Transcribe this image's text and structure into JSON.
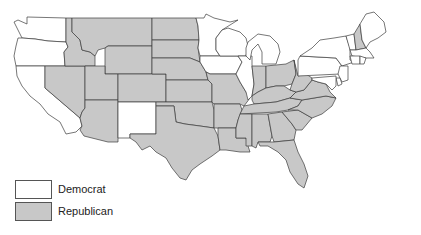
{
  "chart_data": {
    "type": "choropleth",
    "title": "",
    "legend_position": "bottom-left",
    "legend": [
      {
        "label": "Democrat",
        "color": "#ffffff"
      },
      {
        "label": "Republican",
        "color": "#c8c8c8"
      }
    ],
    "states": {
      "Democrat": [
        "WA",
        "OR",
        "CA",
        "NM",
        "MN",
        "WI",
        "IA",
        "IL",
        "MI",
        "PA",
        "NY",
        "VT",
        "ME",
        "MA",
        "RI",
        "CT",
        "NJ",
        "DE",
        "MD",
        "DC",
        "HI"
      ],
      "Republican": [
        "ID",
        "MT",
        "WY",
        "NV",
        "UT",
        "AZ",
        "CO",
        "ND",
        "SD",
        "NE",
        "KS",
        "OK",
        "TX",
        "MO",
        "AR",
        "LA",
        "MS",
        "AL",
        "GA",
        "FL",
        "SC",
        "NC",
        "TN",
        "KY",
        "IN",
        "OH",
        "WV",
        "VA",
        "NH",
        "AK"
      ]
    }
  },
  "legend": {
    "items": [
      {
        "label": "Democrat",
        "color": "#ffffff"
      },
      {
        "label": "Republican",
        "color": "#c8c8c8"
      }
    ]
  },
  "colors": {
    "democrat": "#ffffff",
    "republican": "#c8c8c8",
    "border": "#3c3c3c"
  }
}
